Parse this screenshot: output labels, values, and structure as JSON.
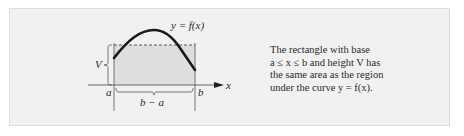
{
  "figure": {
    "curve_label": "y = f(x)",
    "height_label": "V",
    "left_bound_label": "a",
    "right_bound_label": "b",
    "base_label": "b − a",
    "axis_label": "x"
  },
  "caption": {
    "lines": [
      "The rectangle with base",
      "a ≤ x ≤ b and height V has",
      "the same area as the region",
      "under the curve y = f(x)."
    ]
  },
  "colors": {
    "panel_bg": "#f1f1f1",
    "shaded_region": "#dedede",
    "curve": "#1a1a1a"
  }
}
